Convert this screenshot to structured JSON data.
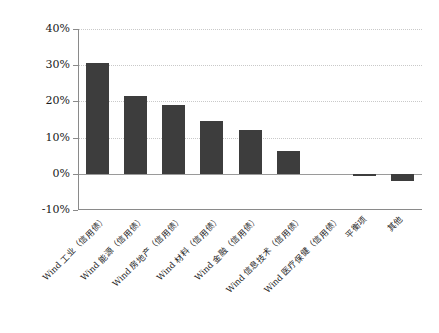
{
  "chart_data": {
    "type": "bar",
    "title": "",
    "subtitle": "",
    "xlabel": "",
    "ylabel": "",
    "ylim": [
      -10,
      40
    ],
    "ytick_values": [
      40,
      30,
      20,
      10,
      0,
      -10
    ],
    "ytick_labels": [
      "40%",
      "30%",
      "20%",
      "10%",
      "0%",
      "-10%"
    ],
    "grid": true,
    "legend": false,
    "legend_position": "none",
    "bar_color": "#3d3d3d",
    "gridline_color": "#c9c9c9",
    "axis_color": "#8a8a8a",
    "categories": [
      "Wind 工业（信用债）",
      "Wind 能源（信用债）",
      "Wind 房地产（信用债）",
      "Wind 材料（信用债）",
      "Wind 金融（信用债）",
      "Wind 信息技术（信用债）",
      "Wind 医疗保健（信用债）",
      "平衡项",
      "其他"
    ],
    "values": [
      30.5,
      21.4,
      19.0,
      14.5,
      12.0,
      6.2,
      0.0,
      -0.5,
      -2.0
    ],
    "value_labels": [
      "30.5%",
      "21.4%",
      "19.0%",
      "14.5%",
      "12.0%",
      "6.2%",
      "0.0%",
      "-0.5%",
      "-2.0%"
    ],
    "series": [
      {
        "name": "",
        "values": [
          30.5,
          21.4,
          19.0,
          14.5,
          12.0,
          6.2,
          0.0,
          -0.5,
          -2.0
        ]
      }
    ]
  }
}
